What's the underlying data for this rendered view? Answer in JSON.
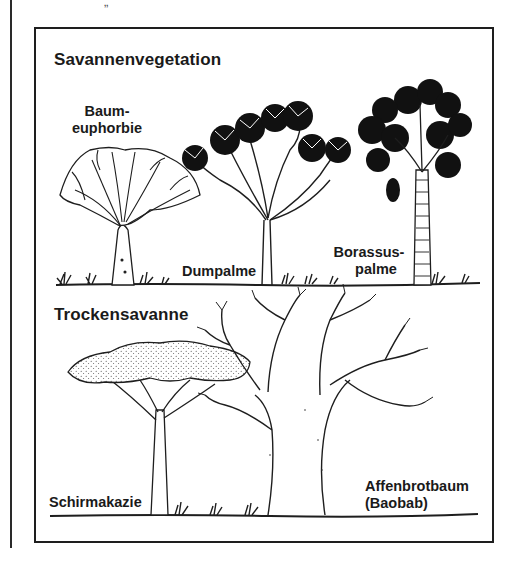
{
  "figure": {
    "top_fragment": "„",
    "sections": [
      {
        "title": "Savannenvegetation",
        "plants": [
          {
            "label_line1": "Baum-",
            "label_line2": "euphorbie",
            "icon": "euphorbia-tree-icon"
          },
          {
            "label_line1": "Dumpalme",
            "label_line2": "",
            "icon": "doum-palm-icon"
          },
          {
            "label_line1": "Borassus-",
            "label_line2": "palme",
            "icon": "borassus-palm-icon"
          }
        ]
      },
      {
        "title": "Trockensavanne",
        "plants": [
          {
            "label_line1": "Schirmakazie",
            "label_line2": "",
            "icon": "umbrella-acacia-icon"
          },
          {
            "label_line1": "Affenbrotbaum",
            "label_line2": "(Baobab)",
            "icon": "baobab-tree-icon"
          }
        ]
      }
    ],
    "colors": {
      "ink": "#1a1a1a",
      "paper": "#ffffff"
    }
  }
}
